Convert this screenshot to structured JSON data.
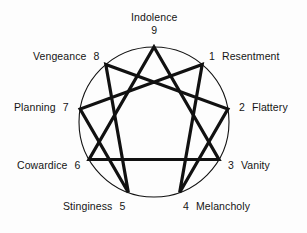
{
  "figure": {
    "type": "enneagram-diagram",
    "background_color": "#fdfdfd",
    "stroke_color": "#111111",
    "circle_stroke_width": 1.1,
    "line_stroke_width": 3.2,
    "circle": {
      "cx": 154,
      "cy": 122,
      "r": 75
    }
  },
  "points": [
    {
      "id": "point-9",
      "number": "9",
      "label": "Indolence",
      "angle_deg": 90,
      "label_position": "top",
      "label_layout": "stacked"
    },
    {
      "id": "point-1",
      "number": "1",
      "label": "Resentment",
      "angle_deg": 50,
      "label_position": "upper-right",
      "label_layout": "inline"
    },
    {
      "id": "point-2",
      "number": "2",
      "label": "Flattery",
      "angle_deg": 10,
      "label_position": "right",
      "label_layout": "inline"
    },
    {
      "id": "point-3",
      "number": "3",
      "label": "Vanity",
      "angle_deg": -30,
      "label_position": "lower-right",
      "label_layout": "inline"
    },
    {
      "id": "point-4",
      "number": "4",
      "label": "Melancholy",
      "angle_deg": -70,
      "label_position": "bottom-right",
      "label_layout": "inline"
    },
    {
      "id": "point-5",
      "number": "5",
      "label": "Stinginess",
      "angle_deg": -110,
      "label_position": "bottom-left",
      "label_layout": "inline"
    },
    {
      "id": "point-6",
      "number": "6",
      "label": "Cowardice",
      "angle_deg": -150,
      "label_position": "lower-left",
      "label_layout": "inline"
    },
    {
      "id": "point-7",
      "number": "7",
      "label": "Planning",
      "angle_deg": 170,
      "label_position": "left",
      "label_layout": "inline"
    },
    {
      "id": "point-8",
      "number": "8",
      "label": "Vengeance",
      "angle_deg": 130,
      "label_position": "upper-left",
      "label_layout": "inline"
    }
  ],
  "triangle": {
    "name": "inner-triangle",
    "sequence": [
      "9",
      "3",
      "6",
      "9"
    ]
  },
  "hexad": {
    "name": "hexad-path",
    "sequence": [
      "1",
      "4",
      "2",
      "8",
      "5",
      "7",
      "1"
    ]
  }
}
